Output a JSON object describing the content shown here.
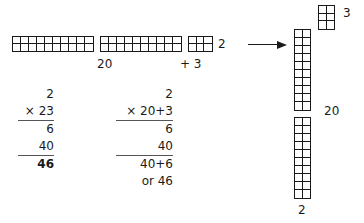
{
  "horizontal_model": {
    "strips": [
      {
        "cols": 10,
        "rows": 2
      },
      {
        "cols": 10,
        "rows": 2
      },
      {
        "cols": 3,
        "rows": 2
      }
    ],
    "height_label": "2",
    "tens_label": "20",
    "ones_label": "+ 3"
  },
  "arrow": {
    "direction": "right"
  },
  "vertical_model": {
    "columns": [
      {
        "cols": 2,
        "rows": 10
      },
      {
        "cols": 2,
        "rows": 10
      }
    ],
    "small_block": {
      "cols": 2,
      "rows": 3
    },
    "small_label": "3",
    "tens_label": "20",
    "width_label": "2"
  },
  "calc_standard": {
    "rows": [
      "2",
      "× 23",
      "6",
      "40",
      "46"
    ]
  },
  "calc_expanded": {
    "rows": [
      "2",
      "× 20+3",
      "6",
      "40",
      "40+6",
      "or 46"
    ]
  }
}
